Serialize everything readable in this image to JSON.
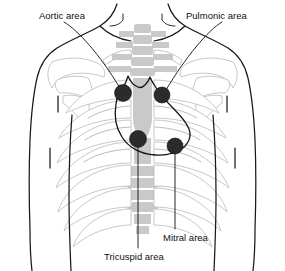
{
  "figure": {
    "background_color": "#ffffff",
    "width": 285,
    "height": 271
  },
  "colors": {
    "outline": "#1a1a1a",
    "bone_gray": "#c9c9c9",
    "bone_light": "#e3e3e3",
    "dot": "#2b2b2b",
    "label_text": "#111111",
    "heart_outline": "#151515"
  },
  "labels": {
    "aortic": "Aortic area",
    "pulmonic": "Pulmonic area",
    "mitral": "Mitral area",
    "tricuspid": "Tricuspid area"
  },
  "auscultation_points": [
    {
      "name": "aortic",
      "label": "Aortic area",
      "x": 123,
      "y": 93,
      "r": 8.5,
      "label_x": 39,
      "label_y": 16
    },
    {
      "name": "pulmonic",
      "label": "Pulmonic area",
      "x": 162,
      "y": 95,
      "r": 8.0,
      "label_x": 186,
      "label_y": 16
    },
    {
      "name": "tricuspid",
      "label": "Tricuspid area",
      "x": 138,
      "y": 139,
      "r": 8.5,
      "label_x": 104,
      "label_y": 257
    },
    {
      "name": "mitral",
      "label": "Mitral area",
      "x": 175,
      "y": 146,
      "r": 8.0,
      "label_x": 163,
      "label_y": 238
    }
  ],
  "anatomy_parts": [
    "torso-outline",
    "left-shoulder",
    "right-shoulder",
    "clavicle-left",
    "clavicle-right",
    "sternum",
    "spine-column",
    "rib-cage-left",
    "rib-cage-right",
    "scapula-left",
    "scapula-right",
    "heart-silhouette"
  ]
}
